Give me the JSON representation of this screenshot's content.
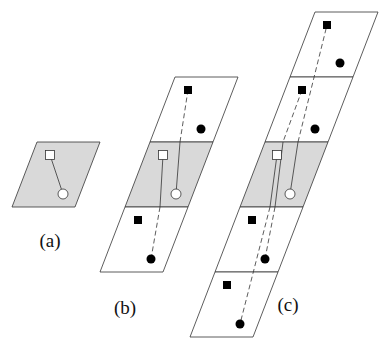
{
  "colors": {
    "shaded_cell": "#d9d9d9",
    "empty_cell": "#ffffff",
    "stroke": "#333333",
    "filled_marker": "#000000",
    "open_marker": "#ffffff"
  },
  "panels": [
    {
      "id": "a",
      "label": "(a)",
      "label_pos": [
        50,
        247
      ],
      "cells": [
        {
          "shaded": true,
          "points": "37,142 100,142 75,207 12,207"
        }
      ],
      "open_square": [
        50,
        155
      ],
      "open_circle": [
        63,
        194
      ],
      "filled_squares": [],
      "filled_circles": [],
      "solid_lines": [
        [
          50,
          155,
          63,
          194
        ]
      ],
      "dashed_lines": []
    },
    {
      "id": "b",
      "label": "(b)",
      "label_pos": [
        125,
        314
      ],
      "cells": [
        {
          "shaded": false,
          "points": "175,77 238,77 213,142 150,142"
        },
        {
          "shaded": true,
          "points": "150,142 213,142 188,207 125,207"
        },
        {
          "shaded": false,
          "points": "125,207 188,207 163,272 100,272"
        }
      ],
      "open_square": [
        163,
        155
      ],
      "open_circle": [
        176,
        194
      ],
      "filled_squares": [
        [
          188,
          90
        ],
        [
          138,
          220
        ]
      ],
      "filled_circles": [
        [
          201,
          129
        ],
        [
          151,
          259
        ]
      ],
      "solid_lines": [
        [
          163,
          155,
          160,
          207
        ],
        [
          176,
          194,
          180,
          142
        ]
      ],
      "dashed_lines": [
        [
          160,
          207,
          151,
          259
        ],
        [
          180,
          142,
          188,
          90
        ]
      ]
    },
    {
      "id": "c",
      "label": "(c)",
      "label_pos": [
        288,
        311
      ],
      "cells": [
        {
          "shaded": false,
          "points": "315,12 378,12 353,77 290,77"
        },
        {
          "shaded": false,
          "points": "290,77 353,77 328,142 265,142"
        },
        {
          "shaded": true,
          "points": "265,142 328,142 303,207 240,207"
        },
        {
          "shaded": false,
          "points": "240,207 303,207 278,272 215,272"
        },
        {
          "shaded": false,
          "points": "215,272 278,272 253,337 190,337"
        }
      ],
      "open_square": [
        277,
        155
      ],
      "open_circle": [
        290,
        194
      ],
      "filled_squares": [
        [
          327,
          25
        ],
        [
          302,
          90
        ],
        [
          252,
          220
        ],
        [
          227,
          285
        ]
      ],
      "filled_circles": [
        [
          340,
          63
        ],
        [
          315,
          129
        ],
        [
          265,
          259
        ],
        [
          240,
          324
        ]
      ],
      "solid_lines": [
        [
          277,
          155,
          270,
          207
        ],
        [
          290,
          194,
          298,
          142
        ],
        [
          283,
          142,
          275,
          207
        ]
      ],
      "dashed_lines": [
        [
          270,
          207,
          240,
          324
        ],
        [
          298,
          142,
          327,
          25
        ],
        [
          302,
          90,
          283,
          142
        ],
        [
          275,
          207,
          265,
          259
        ]
      ]
    }
  ]
}
